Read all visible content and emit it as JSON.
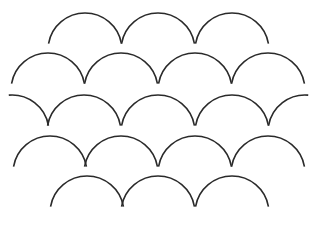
{
  "figure": {
    "stroke_color": "#2a2a2a",
    "background": "#ffffff",
    "radius": 37,
    "rows": [
      {
        "name": "row-1",
        "top_y": 13,
        "centers": [
          85,
          158,
          232
        ],
        "partial": []
      },
      {
        "name": "row-2",
        "top_y": 53,
        "centers": [
          48,
          121,
          195,
          268
        ],
        "partial": []
      },
      {
        "name": "row-3",
        "top_y": 95,
        "centers": [
          84,
          158,
          232
        ],
        "partial": [
          12,
          305
        ]
      },
      {
        "name": "row-4",
        "top_y": 136,
        "centers": [
          50,
          121,
          195,
          268
        ],
        "partial": []
      },
      {
        "name": "row-5",
        "top_y": 176,
        "centers": [
          87,
          158,
          232
        ],
        "partial": []
      }
    ]
  }
}
